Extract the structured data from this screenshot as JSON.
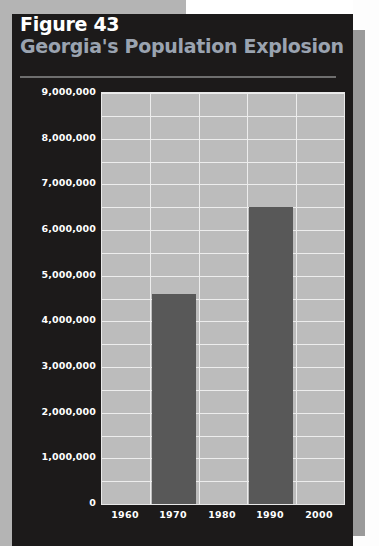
{
  "figure": {
    "number_label": "Figure 43",
    "title": "Georgia's Population Explosion"
  },
  "colors": {
    "panel_background": "#1c1a1a",
    "plot_background": "#bcbcbc",
    "gridline": "#ededed",
    "bar": "#585858",
    "figure_number_text": "#ffffff",
    "title_text": "#9aa3b0",
    "axis_label_text": "#ffffff",
    "backdrop": "#b4b4b4"
  },
  "chart_data": {
    "type": "bar",
    "title": "Georgia's Population Explosion",
    "subtitle": "Figure 43",
    "xlabel": "",
    "ylabel": "",
    "categories": [
      "1960",
      "1970",
      "1980",
      "1990",
      "2000"
    ],
    "values": [
      null,
      4600000,
      null,
      6500000,
      null
    ],
    "series": [
      {
        "name": "Population",
        "values": [
          null,
          4600000,
          null,
          6500000,
          null
        ]
      }
    ],
    "ylim": [
      0,
      9000000
    ],
    "ytick_values": [
      0,
      1000000,
      2000000,
      3000000,
      4000000,
      5000000,
      6000000,
      7000000,
      8000000,
      9000000
    ],
    "ytick_labels": [
      "0",
      "1,000,000",
      "2,000,000",
      "3,000,000",
      "4,000,000",
      "5,000,000",
      "6,000,000",
      "7,000,000",
      "8,000,000",
      "9,000,000"
    ],
    "xtick_labels": [
      "1960",
      "1970",
      "1980",
      "1990",
      "2000"
    ],
    "grid": true,
    "minor_gridline_step": 500000,
    "legend": null,
    "legend_position": "none",
    "annotations": []
  }
}
